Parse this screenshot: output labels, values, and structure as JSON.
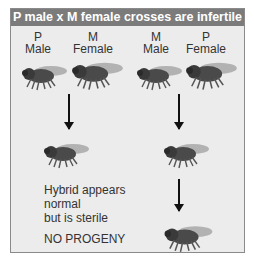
{
  "title": "P male x M female crosses are infertile",
  "parents": [
    {
      "strain": "P",
      "sex": "Male"
    },
    {
      "strain": "M",
      "sex": "Female"
    },
    {
      "strain": "M",
      "sex": "Male"
    },
    {
      "strain": "P",
      "sex": "Female"
    }
  ],
  "left_cross": {
    "note_lines": [
      "Hybrid appears",
      "normal",
      "but is sterile"
    ],
    "result": "NO PROGENY"
  },
  "icons": {
    "fly": "fruit-fly-icon",
    "arrow": "down-arrow-icon"
  },
  "colors": {
    "header_bg": "#7b7b7b",
    "panel_bg": "#ececec",
    "border": "#8a8a8a"
  }
}
